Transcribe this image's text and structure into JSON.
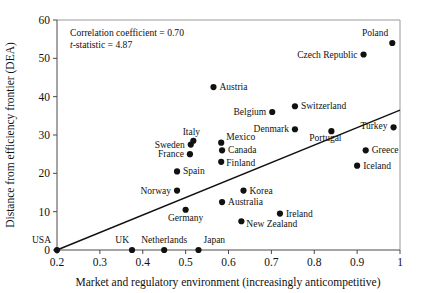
{
  "chart_data": {
    "type": "scatter",
    "title": "",
    "xlabel": "Market and regulatory environment (increasingly anticompetitive)",
    "ylabel": "Distance from efficiency frontier (DEA)",
    "xlim": [
      0.2,
      1.0
    ],
    "ylim": [
      0,
      60
    ],
    "xticks": [
      "0.2",
      "0.3",
      "0.4",
      "0.5",
      "0.6",
      "0.7",
      "0.8",
      "0.9",
      "1"
    ],
    "xtick_values": [
      0.2,
      0.3,
      0.4,
      0.5,
      0.6,
      0.7,
      0.8,
      0.9,
      1.0
    ],
    "yticks": [
      "0",
      "10",
      "20",
      "30",
      "40",
      "50",
      "60"
    ],
    "ytick_values": [
      0,
      10,
      20,
      30,
      40,
      50,
      60
    ],
    "grid": false,
    "legend": "none",
    "annotations": [
      {
        "name": "correlation-coefficient",
        "text": "Correlation coefficient = 0.70"
      },
      {
        "name": "t-statistic",
        "text_italic": "t",
        "text": "-statistic = 4.87"
      }
    ],
    "trendline": {
      "x0": 0.2,
      "y0": 0.0,
      "x1": 1.0,
      "y1": 36.5
    },
    "points": [
      {
        "label": "USA",
        "x": 0.2,
        "y": 0.0,
        "lx": -6,
        "ly": -7,
        "anchor": "end"
      },
      {
        "label": "UK",
        "x": 0.375,
        "y": 0.0,
        "lx": -3,
        "ly": -7,
        "anchor": "end"
      },
      {
        "label": "Netherlands",
        "x": 0.45,
        "y": 0.0,
        "lx": 0,
        "ly": -7,
        "anchor": "middle"
      },
      {
        "label": "Japan",
        "x": 0.53,
        "y": 0.0,
        "lx": 5,
        "ly": -7,
        "anchor": "start"
      },
      {
        "label": "New Zealand",
        "x": 0.63,
        "y": 7.5,
        "lx": 5,
        "ly": 6,
        "anchor": "start"
      },
      {
        "label": "Ireland",
        "x": 0.72,
        "y": 9.5,
        "lx": 6,
        "ly": 3,
        "anchor": "start"
      },
      {
        "label": "Germany",
        "x": 0.5,
        "y": 10.5,
        "lx": 0,
        "ly": 11,
        "anchor": "middle"
      },
      {
        "label": "Australia",
        "x": 0.585,
        "y": 12.5,
        "lx": 6,
        "ly": 3,
        "anchor": "start"
      },
      {
        "label": "Norway",
        "x": 0.48,
        "y": 15.5,
        "lx": -6,
        "ly": 3,
        "anchor": "end"
      },
      {
        "label": "Korea",
        "x": 0.635,
        "y": 15.5,
        "lx": 6,
        "ly": 3,
        "anchor": "start"
      },
      {
        "label": "Spain",
        "x": 0.48,
        "y": 20.5,
        "lx": 6,
        "ly": 3,
        "anchor": "start"
      },
      {
        "label": "Iceland",
        "x": 0.9,
        "y": 22.0,
        "lx": 6,
        "ly": 3,
        "anchor": "start"
      },
      {
        "label": "Finland",
        "x": 0.583,
        "y": 23.0,
        "lx": 5,
        "ly": 4,
        "anchor": "start"
      },
      {
        "label": "France",
        "x": 0.51,
        "y": 25.0,
        "lx": -6,
        "ly": 3,
        "anchor": "end"
      },
      {
        "label": "Canada",
        "x": 0.585,
        "y": 26.0,
        "lx": 6,
        "ly": 3,
        "anchor": "start"
      },
      {
        "label": "Greece",
        "x": 0.92,
        "y": 26.0,
        "lx": 6,
        "ly": 3,
        "anchor": "start"
      },
      {
        "label": "Sweden",
        "x": 0.512,
        "y": 27.5,
        "lx": -6,
        "ly": 3,
        "anchor": "end"
      },
      {
        "label": "Mexico",
        "x": 0.583,
        "y": 28.0,
        "lx": 5,
        "ly": -3,
        "anchor": "start"
      },
      {
        "label": "Italy",
        "x": 0.518,
        "y": 28.5,
        "lx": -2,
        "ly": -6,
        "anchor": "middle"
      },
      {
        "label": "Portugal",
        "x": 0.84,
        "y": 31.0,
        "lx": -6,
        "ly": 10,
        "anchor": "middle"
      },
      {
        "label": "Denmark",
        "x": 0.755,
        "y": 31.5,
        "lx": -6,
        "ly": 3,
        "anchor": "end"
      },
      {
        "label": "Turkey",
        "x": 0.985,
        "y": 32.0,
        "lx": -6,
        "ly": 2,
        "anchor": "end"
      },
      {
        "label": "Belgium",
        "x": 0.702,
        "y": 36.0,
        "lx": -6,
        "ly": 3,
        "anchor": "end"
      },
      {
        "label": "Switzerland",
        "x": 0.755,
        "y": 37.5,
        "lx": 6,
        "ly": 3,
        "anchor": "start"
      },
      {
        "label": "Austria",
        "x": 0.565,
        "y": 42.5,
        "lx": 6,
        "ly": 3,
        "anchor": "start"
      },
      {
        "label": "Czech Republic",
        "x": 0.915,
        "y": 51.0,
        "lx": -6,
        "ly": 3,
        "anchor": "end"
      },
      {
        "label": "Poland",
        "x": 0.982,
        "y": 54.0,
        "lx": -4,
        "ly": -7,
        "anchor": "end"
      }
    ]
  }
}
